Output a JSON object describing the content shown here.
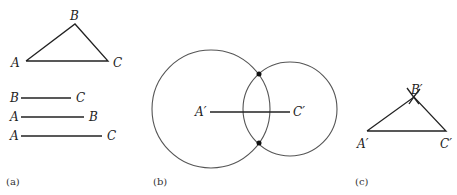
{
  "panel_a": {
    "caption": "(a)",
    "triangle": {
      "A": "A",
      "B": "B",
      "C": "C"
    },
    "segments": [
      {
        "left": "B",
        "right": "C"
      },
      {
        "left": "A",
        "right": "B"
      },
      {
        "left": "A",
        "right": "C"
      }
    ]
  },
  "panel_b": {
    "caption": "(b)",
    "left_label": "A′",
    "right_label": "C′"
  },
  "panel_c": {
    "caption": "(c)",
    "A": "A′",
    "B": "B′",
    "C": "C′"
  }
}
